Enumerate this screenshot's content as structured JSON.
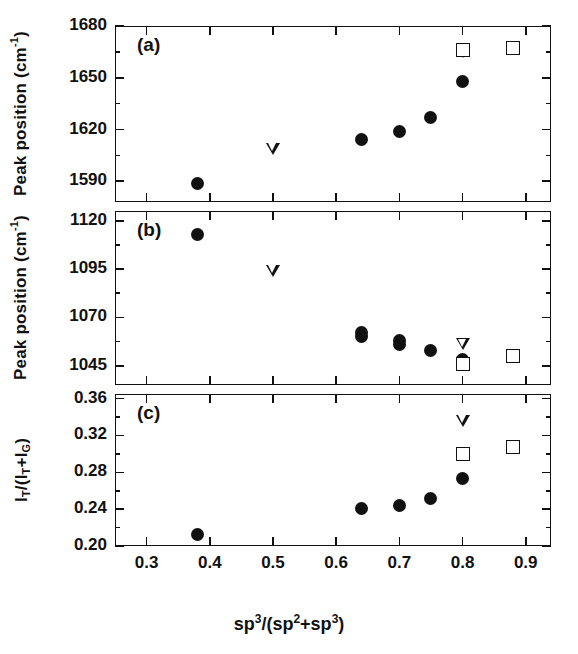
{
  "figure": {
    "xlabel": "sp3/(sp2+sp3)",
    "xlabel_parts": {
      "a": "sp",
      "sup1": "3",
      "mid": "/(sp",
      "sup2": "2",
      "plus": "+sp",
      "sup3": "3",
      "close": ")"
    },
    "ylabel_ab": "Peak position (cm-1)",
    "ylabel_c": "IT/(IT+IG)"
  },
  "chart_data": [
    {
      "type": "scatter",
      "panel": "(a)",
      "title": "",
      "xlabel": "sp3/(sp2+sp3)",
      "ylabel": "Peak position (cm-1)",
      "xlim": [
        0.25,
        0.94
      ],
      "ylim": [
        1578,
        1680
      ],
      "xticks": [
        0.3,
        0.4,
        0.5,
        0.6,
        0.7,
        0.8,
        0.9
      ],
      "xticklabels": [
        "0.3",
        "0.4",
        "0.5",
        "0.6",
        "0.7",
        "0.8",
        "0.9"
      ],
      "yticks": [
        1590,
        1620,
        1650,
        1680
      ],
      "yticklabels": [
        "1590",
        "1620",
        "1650",
        "1680"
      ],
      "yminorticks": [
        1605,
        1635,
        1665
      ],
      "grid": false,
      "legend": "none",
      "series": [
        {
          "name": "filled-circle",
          "marker": "circle",
          "points": [
            [
              0.38,
              1589
            ],
            [
              0.64,
              1614
            ],
            [
              0.7,
              1619
            ],
            [
              0.75,
              1627
            ],
            [
              0.8,
              1648
            ]
          ]
        },
        {
          "name": "open-down-triangle",
          "marker": "triangle-down",
          "points": [
            [
              0.5,
              1609
            ],
            [
              0.8,
              1665
            ]
          ]
        },
        {
          "name": "open-square",
          "marker": "square",
          "points": [
            [
              0.8,
              1666
            ],
            [
              0.88,
              1667
            ]
          ]
        }
      ]
    },
    {
      "type": "scatter",
      "panel": "(b)",
      "title": "",
      "xlabel": "sp3/(sp2+sp3)",
      "ylabel": "Peak position (cm-1)",
      "xlim": [
        0.25,
        0.94
      ],
      "ylim": [
        1035,
        1125
      ],
      "xticks": [
        0.3,
        0.4,
        0.5,
        0.6,
        0.7,
        0.8,
        0.9
      ],
      "xticklabels": [
        "0.3",
        "0.4",
        "0.5",
        "0.6",
        "0.7",
        "0.8",
        "0.9"
      ],
      "yticks": [
        1045,
        1070,
        1095,
        1120
      ],
      "yticklabels": [
        "1045",
        "1070",
        "1095",
        "1120"
      ],
      "yminorticks": [
        1057.5,
        1082.5,
        1107.5
      ],
      "grid": false,
      "legend": "none",
      "series": [
        {
          "name": "filled-circle",
          "marker": "circle",
          "points": [
            [
              0.38,
              1113
            ],
            [
              0.64,
              1062
            ],
            [
              0.64,
              1060
            ],
            [
              0.7,
              1058
            ],
            [
              0.7,
              1056
            ],
            [
              0.75,
              1053
            ],
            [
              0.8,
              1048
            ],
            [
              0.8,
              1047
            ]
          ]
        },
        {
          "name": "open-down-triangle",
          "marker": "triangle-down",
          "points": [
            [
              0.5,
              1094
            ],
            [
              0.8,
              1056
            ]
          ]
        },
        {
          "name": "open-square",
          "marker": "square",
          "points": [
            [
              0.8,
              1046
            ],
            [
              0.88,
              1050
            ]
          ]
        }
      ]
    },
    {
      "type": "scatter",
      "panel": "(c)",
      "title": "",
      "xlabel": "sp3/(sp2+sp3)",
      "ylabel": "IT/(IT+IG)",
      "xlim": [
        0.25,
        0.94
      ],
      "ylim": [
        0.2,
        0.365
      ],
      "xticks": [
        0.3,
        0.4,
        0.5,
        0.6,
        0.7,
        0.8,
        0.9
      ],
      "xticklabels": [
        "0.3",
        "0.4",
        "0.5",
        "0.6",
        "0.7",
        "0.8",
        "0.9"
      ],
      "yticks": [
        0.2,
        0.24,
        0.28,
        0.32,
        0.36
      ],
      "yticklabels": [
        "0.20",
        "0.24",
        "0.28",
        "0.32",
        "0.36"
      ],
      "yminorticks": [
        0.22,
        0.26,
        0.3,
        0.34
      ],
      "grid": false,
      "legend": "none",
      "series": [
        {
          "name": "filled-circle",
          "marker": "circle",
          "points": [
            [
              0.38,
              0.213
            ],
            [
              0.64,
              0.241
            ],
            [
              0.7,
              0.244
            ],
            [
              0.75,
              0.252
            ],
            [
              0.8,
              0.273
            ]
          ]
        },
        {
          "name": "open-down-triangle",
          "marker": "triangle-down",
          "points": [
            [
              0.8,
              0.336
            ]
          ]
        },
        {
          "name": "open-square",
          "marker": "square",
          "points": [
            [
              0.8,
              0.3
            ],
            [
              0.88,
              0.307
            ]
          ]
        }
      ]
    }
  ]
}
